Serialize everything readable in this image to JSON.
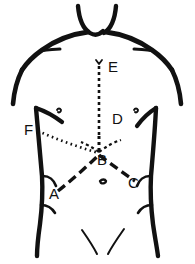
{
  "figure": {
    "background_color": "#ffffff",
    "ink_color": "#111111",
    "width": 195,
    "height": 264
  },
  "labels": [
    {
      "id": "E",
      "text": "E",
      "x": 108,
      "y": 72,
      "description": "suprasternal / upper midline point"
    },
    {
      "id": "D",
      "text": "D",
      "x": 112,
      "y": 124,
      "description": "lower sternum midline point"
    },
    {
      "id": "B",
      "text": "B",
      "x": 97,
      "y": 165,
      "description": "central xiphoid junction point"
    },
    {
      "id": "F",
      "text": "F",
      "x": 24,
      "y": 135,
      "description": "left lateral costal point"
    },
    {
      "id": "A",
      "text": "A",
      "x": 49,
      "y": 199,
      "description": "left lower lateral point"
    },
    {
      "id": "C",
      "text": "C",
      "x": 128,
      "y": 188,
      "description": "right lower lateral point"
    }
  ],
  "incisions": [
    {
      "name": "midline-vertical-E-D",
      "style": "dashed",
      "from": "E",
      "to": "D",
      "dash": "3,3",
      "stroke_width": 2.6
    },
    {
      "name": "oblique-dotted-F-B",
      "style": "dotted",
      "from": "F",
      "to": "B",
      "dash": "1.6,3.4",
      "stroke_width": 2.6
    },
    {
      "name": "chevron-A-B-C",
      "style": "dashed-thick",
      "from": "A",
      "via": "B",
      "to": "C",
      "dash": "9,5",
      "stroke_width": 3.4
    }
  ],
  "anatomy_marks": [
    {
      "name": "sternal-notch-mark"
    },
    {
      "name": "left-nipple-mark"
    },
    {
      "name": "right-nipple-mark"
    },
    {
      "name": "umbilicus-mark"
    },
    {
      "name": "left-costal-margin"
    },
    {
      "name": "right-costal-margin"
    },
    {
      "name": "left-inguinal-crease"
    },
    {
      "name": "right-inguinal-crease"
    },
    {
      "name": "left-hip-crease"
    },
    {
      "name": "right-hip-crease"
    }
  ]
}
